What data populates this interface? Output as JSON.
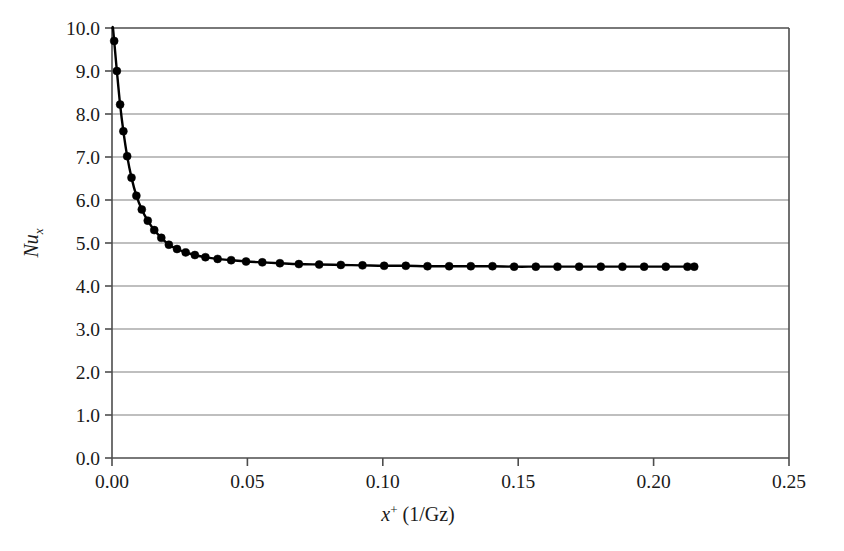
{
  "chart_data": {
    "type": "line",
    "title": "",
    "subtitle": "",
    "xlabel_plain": "x+ (1/Gz)",
    "xlabel_parts": {
      "symbol": "x",
      "superscript": "+",
      "rest": " (1/Gz)"
    },
    "ylabel_plain": "Nux",
    "ylabel_parts": {
      "symbol": "Nu",
      "subscript": "x"
    },
    "xlim": [
      0.0,
      0.25
    ],
    "ylim": [
      0.0,
      10.0
    ],
    "xticks": [
      0.0,
      0.05,
      0.1,
      0.15,
      0.2,
      0.25
    ],
    "xticklabels": [
      "0.00",
      "0.05",
      "0.10",
      "0.15",
      "0.20",
      "0.25"
    ],
    "yticks": [
      0.0,
      1.0,
      2.0,
      3.0,
      4.0,
      5.0,
      6.0,
      7.0,
      8.0,
      9.0,
      10.0
    ],
    "yticklabels": [
      "0.0",
      "1.0",
      "2.0",
      "3.0",
      "4.0",
      "5.0",
      "6.0",
      "7.0",
      "8.0",
      "9.0",
      "10.0"
    ],
    "grid": "horizontal",
    "grid_color": "#808080",
    "frame_color": "#4d4d4d",
    "legend": null,
    "series": [
      {
        "name": "Nux vs x+",
        "style": "line-with-markers",
        "line_color": "#000000",
        "marker_color": "#000000",
        "marker": "filled-circle",
        "x": [
          0.0008,
          0.0018,
          0.003,
          0.0042,
          0.0056,
          0.0072,
          0.009,
          0.011,
          0.0132,
          0.0156,
          0.0182,
          0.021,
          0.024,
          0.0272,
          0.0306,
          0.0345,
          0.039,
          0.044,
          0.0495,
          0.0555,
          0.062,
          0.069,
          0.0765,
          0.0845,
          0.0925,
          0.1005,
          0.1085,
          0.1165,
          0.1245,
          0.1325,
          0.1405,
          0.1485,
          0.1565,
          0.1645,
          0.1725,
          0.1805,
          0.1885,
          0.1965,
          0.2045,
          0.2125,
          0.215
        ],
        "y": [
          9.7,
          9.0,
          8.22,
          7.6,
          7.02,
          6.52,
          6.1,
          5.78,
          5.52,
          5.3,
          5.12,
          4.96,
          4.86,
          4.78,
          4.72,
          4.67,
          4.63,
          4.6,
          4.57,
          4.55,
          4.53,
          4.51,
          4.5,
          4.49,
          4.48,
          4.47,
          4.47,
          4.46,
          4.46,
          4.46,
          4.46,
          4.45,
          4.45,
          4.45,
          4.45,
          4.45,
          4.45,
          4.45,
          4.45,
          4.45,
          4.45
        ],
        "asymptote": 4.45,
        "notes": "Thermal entrance (Graetz) solution: local Nusselt number decaying from ~9.7 near the inlet to a fully developed value of about 4.45."
      }
    ]
  }
}
